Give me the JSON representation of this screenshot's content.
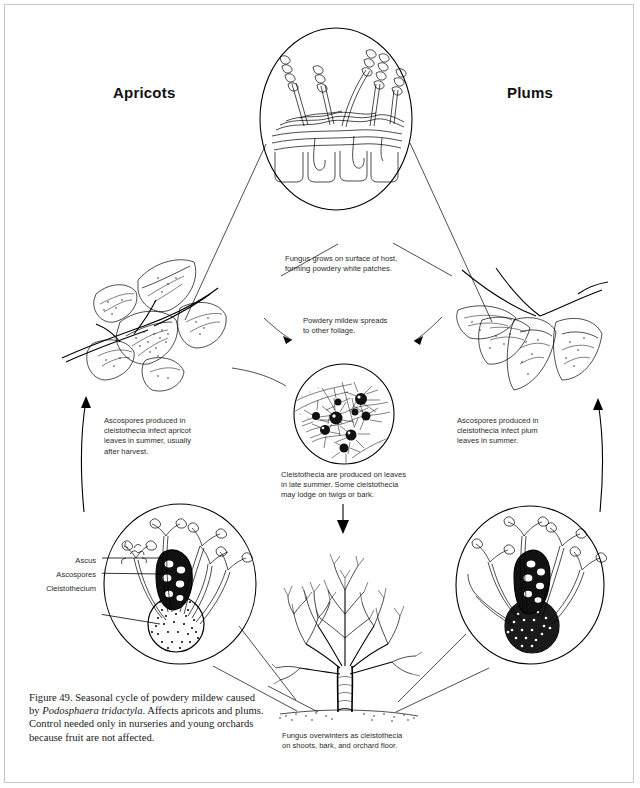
{
  "figure": {
    "number": "Figure 49.",
    "caption_pre": "Figure 49. Seasonal cycle of powdery mildew caused by ",
    "caption_species": "Podosphaera tridactyla",
    "caption_post": ". Affects apricots and plums. Control needed only in nurseries and young orchards because fruit are not affected.",
    "caption_full": "Figure 49. Seasonal cycle of powdery mildew caused by Podosphaera tridactyla. Affects apricots and plums. Control needed only in nurseries and young orchards because fruit are not affected."
  },
  "hosts": {
    "left": "Apricots",
    "right": "Plums"
  },
  "notes": {
    "top_inset": "Fungus grows on surface of host,\nforming powdery white patches.",
    "spread": "Powdery mildew spreads\nto other foilage.",
    "left_cycle": "Ascospores produced in\ncleistothecia infect apricot\nleaves in summer, usually\nafter harvest.",
    "right_cycle": "Ascospores produced in\ncleistothecia infect plum\nleaves in summer.",
    "cleistothecia": "Cleistothecia are produced on leaves\nin late summer. Some cleistothecia\nmay lodge on twigs or bark.",
    "overwinter": "Fungus overwinters as cleistothecia\non shoots, bark, and orchard floor."
  },
  "callouts": {
    "ascus": "Ascus",
    "ascospores": "Ascospores",
    "cleistothecium": "Cleistothecium"
  },
  "illustrations": {
    "top_inset": "conidiophores-on-leaf-epidermis-cross-section",
    "left_foliage": "apricot-leaves-with-powdery-mildew",
    "right_foliage": "plum-leaves-with-powdery-mildew",
    "center_inset": "cleistothecia-on-leaf-surface",
    "bottom_left_inset": "cleistothecium-with-ascus-and-ascospores",
    "bottom_right_inset": "cleistothecium-with-ascus-and-ascospores",
    "dormant_tree": "dormant-tree-with-orchard-floor"
  },
  "colors": {
    "ink": "#000000",
    "paper": "#ffffff",
    "note_text": "#2b2b2b",
    "border": "#c9c9c9"
  }
}
